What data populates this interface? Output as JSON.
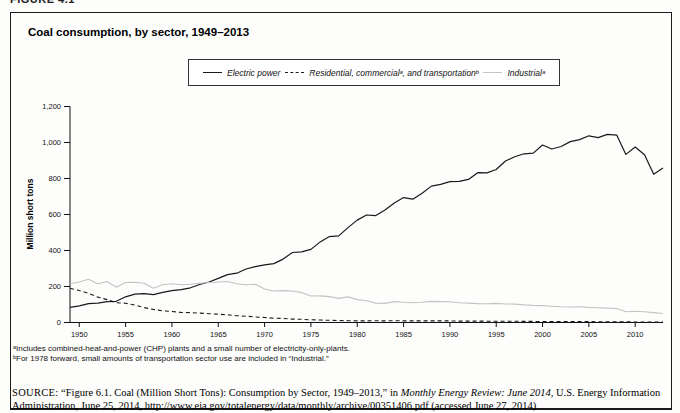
{
  "figure_label": "FIGURE 4.1",
  "chart": {
    "title": "Coal consumption, by sector, 1949–2013",
    "y_axis_title": "Million short tons",
    "legend": [
      {
        "label": "Electric power",
        "swatch": "solid-dark-line"
      },
      {
        "label": "Residential, commercialᵃ, and transportationᵇ",
        "swatch": "dashed-line"
      },
      {
        "label": "Industrialᵃ",
        "swatch": "solid-light-line"
      }
    ]
  },
  "footnotes": [
    "ᵃIncludes combined-heat-and-power (CHP) plants and a small number of electricity-only-plants.",
    "ᵇFor 1978 forward, small amounts of transportation sector use are included in “Industrial.”"
  ],
  "source": {
    "label": "SOURCE:",
    "pre": " “Figure 6.1. Coal (Million Short Tons): Consumption by Sector, 1949–2013,” in ",
    "italic": "Monthly Energy Review: June 2014",
    "post": ", U.S. Energy Information Administration, June 25, 2014, http://www.eia.gov/totalenergy/data/monthly/archive/00351406.pdf (accessed June 27, 2014)"
  },
  "colors": {
    "dark_line": "#1a1a1a",
    "light_line": "#c3c3c3",
    "axis": "#111111"
  },
  "chart_data": {
    "type": "line",
    "title": "Coal consumption, by sector, 1949–2013",
    "xlabel": "",
    "ylabel": "Million short tons",
    "xlim": [
      1949,
      2013
    ],
    "ylim": [
      0,
      1200
    ],
    "x_start": 1949,
    "x_ticks": [
      1950,
      1955,
      1960,
      1965,
      1970,
      1975,
      1980,
      1985,
      1990,
      1995,
      2000,
      2005,
      2010
    ],
    "y_ticks": [
      0,
      200,
      400,
      600,
      800,
      1000,
      1200
    ],
    "grid": false,
    "legend_position": "top",
    "series": [
      {
        "id": "electric-power",
        "name": "Electric power",
        "color": "#1a1a1a",
        "dash": "",
        "width": 1.2,
        "values": [
          84,
          92,
          105,
          107,
          116,
          118,
          143,
          158,
          160,
          155,
          168,
          177,
          182,
          193,
          211,
          225,
          245,
          266,
          274,
          297,
          310,
          320,
          327,
          352,
          389,
          392,
          406,
          448,
          477,
          481,
          527,
          569,
          597,
          594,
          625,
          664,
          694,
          685,
          718,
          758,
          767,
          783,
          784,
          795,
          832,
          831,
          850,
          897,
          921,
          937,
          941,
          986,
          964,
          978,
          1005,
          1016,
          1037,
          1027,
          1045,
          1041,
          934,
          975,
          932,
          824,
          858
        ]
      },
      {
        "id": "residential-commercial-transportation",
        "name": "Residential, commercial, and transportation",
        "color": "#1a1a1a",
        "dash": "4,3",
        "width": 1.1,
        "values": [
          190,
          178,
          162,
          141,
          127,
          110,
          107,
          97,
          83,
          73,
          65,
          61,
          56,
          55,
          52,
          49,
          46,
          43,
          38,
          35,
          31,
          28,
          24,
          22,
          19,
          18,
          15,
          14,
          12,
          11,
          10,
          9,
          9,
          10,
          9,
          10,
          9,
          9,
          9,
          9,
          9,
          9,
          8,
          8,
          8,
          7,
          7,
          7,
          7,
          6,
          6,
          5,
          5,
          5,
          5,
          5,
          5,
          4,
          4,
          4,
          4,
          3,
          3,
          3,
          3
        ]
      },
      {
        "id": "industrial",
        "name": "Industrial",
        "color": "#c3c3c3",
        "dash": "",
        "width": 1.1,
        "values": [
          215,
          225,
          240,
          215,
          228,
          196,
          222,
          224,
          218,
          190,
          210,
          215,
          210,
          213,
          218,
          222,
          225,
          228,
          215,
          210,
          212,
          186,
          175,
          177,
          175,
          166,
          147,
          148,
          144,
          134,
          142,
          127,
          121,
          108,
          106,
          116,
          112,
          110,
          113,
          117,
          116,
          115,
          110,
          108,
          105,
          104,
          106,
          103,
          102,
          98,
          95,
          94,
          90,
          87,
          86,
          88,
          84,
          82,
          80,
          78,
          60,
          63,
          60,
          55,
          50
        ]
      }
    ]
  }
}
